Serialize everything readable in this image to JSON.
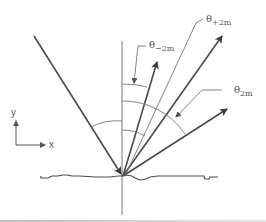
{
  "diagram": {
    "type": "diffraction-geometry",
    "colors": {
      "line": "#4a4a4a",
      "thin": "#777777",
      "text": "#555555",
      "border": "#c8c8c8"
    },
    "labels": {
      "theta_minus_2m": {
        "base": "θ",
        "sub": "−2m"
      },
      "theta_plus_2m": {
        "base": "θ",
        "sub": "+2m"
      },
      "theta_2m": {
        "base": "θ",
        "sub": "2m"
      }
    },
    "axes": {
      "x_label": "x",
      "y_label": "y"
    },
    "elements": [
      "incident-beam",
      "surface-normal",
      "reflected-beam-minus-2m",
      "reflected-beam-plus-2m",
      "reflected-beam-2m",
      "rough-surface-profile",
      "angle-arcs",
      "xy-axes-indicator"
    ]
  }
}
